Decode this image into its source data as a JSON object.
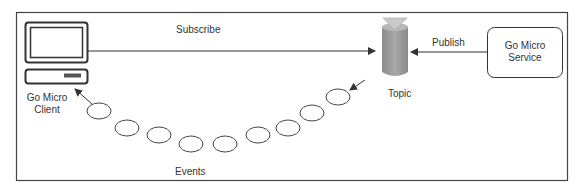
{
  "diagram": {
    "type": "publish-subscribe flow",
    "nodes": {
      "client": {
        "label_line1": "Go Micro",
        "label_line2": "Client",
        "icon": "computer-icon"
      },
      "topic": {
        "label": "Topic",
        "icon": "database-cylinder-icon"
      },
      "service": {
        "label_line1": "Go Micro",
        "label_line2": "Service"
      }
    },
    "edges": {
      "subscribe": {
        "label": "Subscribe",
        "from": "client",
        "to": "topic"
      },
      "publish": {
        "label": "Publish",
        "from": "service",
        "to": "topic"
      },
      "events": {
        "label": "Events",
        "from": "topic",
        "to": "client",
        "event_count": 9
      }
    },
    "colors": {
      "stroke": "#333333",
      "cylinder_fill": "#9a9a9a",
      "cylinder_top": "#c4c4c4",
      "background": "#ffffff"
    }
  }
}
